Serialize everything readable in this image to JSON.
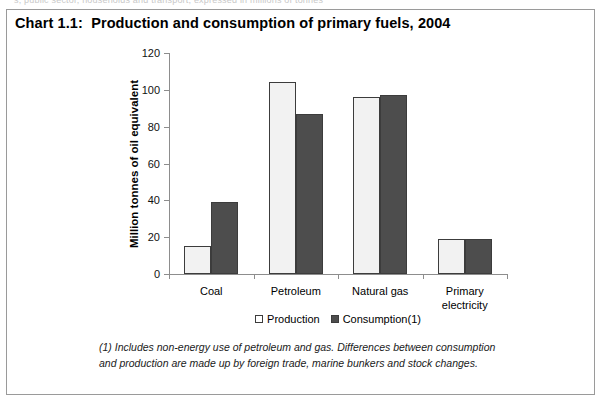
{
  "top_strip_text": "s, public sector, households and transport, expressed in millions of tonnes",
  "chart": {
    "title": "Chart 1.1:  Production and consumption of primary fuels, 2004",
    "legend_position": "bottom-center",
    "footnote": "(1) Includes non-energy use of petroleum and gas. Differences between consumption and production are made up by foreign trade, marine bunkers and stock changes."
  },
  "chart_data": {
    "type": "bar",
    "title": "Chart 1.1:  Production and consumption of primary fuels, 2004",
    "categories": [
      "Coal",
      "Petroleum",
      "Natural gas",
      "Primary\nelectricity"
    ],
    "series": [
      {
        "name": "Production",
        "values": [
          15,
          104.5,
          96,
          19
        ],
        "color": "#f2f2f2"
      },
      {
        "name": "Consumption(1)",
        "values": [
          39,
          87,
          97,
          19
        ],
        "color": "#4d4d4d"
      }
    ],
    "xlabel": "",
    "ylabel": "Million tonnes of oil equivalent",
    "ylim": [
      0,
      120
    ],
    "yticks": [
      0,
      20,
      40,
      60,
      80,
      100,
      120
    ],
    "ytick_labels": [
      "0",
      "20",
      "40",
      "60",
      "80",
      "100",
      "120"
    ],
    "grid": false,
    "legend": [
      "Production",
      "Consumption(1)"
    ]
  }
}
